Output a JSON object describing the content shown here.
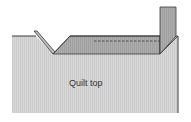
{
  "diagram": {
    "label": "Quilt top",
    "colors": {
      "quilt_top": "#d6d6d6",
      "binding": "#a9a9a9",
      "binding_fold": "#bdbdbd",
      "outline": "#3a3a3a",
      "background": "#ffffff"
    }
  }
}
